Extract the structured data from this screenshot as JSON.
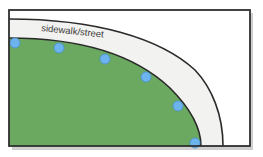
{
  "diagram": {
    "label": "sidewalk/street",
    "colors": {
      "background": "#ffffff",
      "frame": "#2f2f2f",
      "shadow": "#9a9a9a",
      "sidewalk": "#f2f2f0",
      "lawn": "#6aa95f",
      "curve": "#2a2a2a",
      "dot_fill": "#6db4ef",
      "dot_stroke": "#4a8fd0"
    },
    "dots": [
      {
        "x": 15,
        "y": 43
      },
      {
        "x": 59,
        "y": 48
      },
      {
        "x": 105,
        "y": 59
      },
      {
        "x": 146,
        "y": 77
      },
      {
        "x": 178,
        "y": 106
      },
      {
        "x": 195,
        "y": 143
      }
    ]
  }
}
